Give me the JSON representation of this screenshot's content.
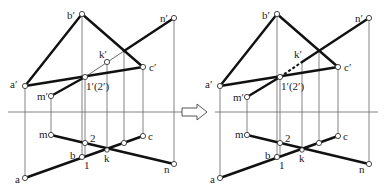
{
  "figure": {
    "transition_arrow": "hollow-right-arrow"
  },
  "left_view": {
    "labels": {
      "a_prime": "a′",
      "b_prime": "b′",
      "c_prime": "c′",
      "n_prime": "n′",
      "m_prime": "m′",
      "k_prime": "k′",
      "one_two_prime": "1′(2′)",
      "a": "a",
      "b": "b",
      "c": "c",
      "m": "m",
      "n": "n",
      "k": "k",
      "one": "1",
      "two": "2"
    }
  },
  "right_view": {
    "labels": {
      "a_prime": "a′",
      "b_prime": "b′",
      "c_prime": "c′",
      "n_prime": "n′",
      "m_prime": "m′",
      "k_prime": "k′",
      "one_two_prime": "1′(2′)",
      "a": "a",
      "b": "b",
      "c": "c",
      "m": "m",
      "n": "n",
      "k": "k",
      "one": "1",
      "two": "2"
    }
  }
}
